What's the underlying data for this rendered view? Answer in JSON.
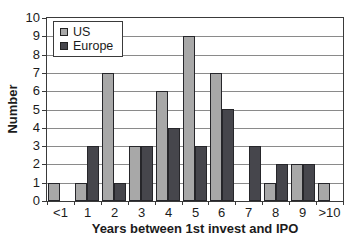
{
  "chart_data": {
    "type": "bar",
    "categories": [
      "<1",
      "1",
      "2",
      "3",
      "4",
      "5",
      "6",
      "7",
      "8",
      "9",
      ">10"
    ],
    "series": [
      {
        "name": "US",
        "color": "#a8a8a8",
        "values": [
          1,
          1,
          7,
          3,
          6,
          9,
          7,
          0,
          1,
          2,
          1
        ]
      },
      {
        "name": "Europe",
        "color": "#46464c",
        "values": [
          0,
          3,
          1,
          3,
          4,
          3,
          5,
          3,
          2,
          2,
          0
        ]
      }
    ],
    "title": "",
    "xlabel": "Years between 1st invest and IPO",
    "ylabel": "Number",
    "ylim": [
      0,
      10
    ],
    "ytick_step": 1,
    "grid": true,
    "legend_position": "top-left",
    "colors": {
      "grid": "#8a8a8a",
      "axis": "#3a3a3a",
      "bar_border": "#26262a",
      "text": "#1b1b1b",
      "plot_bg": "#ffffff"
    }
  }
}
